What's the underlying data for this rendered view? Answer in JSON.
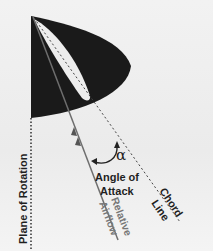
{
  "diagram": {
    "labels": {
      "angle_symbol": "α",
      "angle_line1": "Angle of",
      "angle_line2": "Attack",
      "chord_line1": "Chord",
      "chord_line2": "Line",
      "airflow_line1": "Relative",
      "airflow_line2": "Airflow",
      "plane": "Plane of Rotation"
    },
    "colors": {
      "background": "#efefef",
      "wedge": "#1a1a1a",
      "airfoil": "#ededed",
      "airflow_line": "#6e6e6e",
      "chord_line": "#333333",
      "text_dark": "#1f1f1f",
      "text_gray": "#777777"
    }
  }
}
